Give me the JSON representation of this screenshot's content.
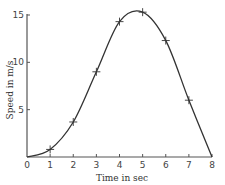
{
  "chart_data": {
    "type": "line",
    "title": "",
    "xlabel": "Time in sec",
    "ylabel": "Speed in m/s",
    "xlim": [
      0,
      8
    ],
    "ylim": [
      0,
      15
    ],
    "x_ticks": [
      0,
      1,
      2,
      3,
      4,
      5,
      6,
      7,
      8
    ],
    "y_ticks": [
      5,
      10,
      15
    ],
    "grid": false,
    "legend": null,
    "series": [
      {
        "name": "speed",
        "marker": "+",
        "x": [
          0,
          1,
          2,
          3,
          4,
          5,
          6,
          7,
          8
        ],
        "values": [
          0,
          0.8,
          3.7,
          9,
          14.3,
          15.3,
          12.3,
          6,
          0
        ]
      }
    ],
    "markers": [
      {
        "x": 1,
        "y": 0.8
      },
      {
        "x": 2,
        "y": 3.7
      },
      {
        "x": 3,
        "y": 9
      },
      {
        "x": 4,
        "y": 14.3
      },
      {
        "x": 5,
        "y": 15.3
      },
      {
        "x": 6,
        "y": 12.3
      },
      {
        "x": 7,
        "y": 6
      }
    ]
  },
  "labels": {
    "xlabel": "Time in sec",
    "ylabel": "Speed in m/s",
    "x_ticks": [
      "0",
      "1",
      "2",
      "3",
      "4",
      "5",
      "6",
      "7",
      "8"
    ],
    "y_ticks": [
      "5",
      "10",
      "15"
    ]
  }
}
